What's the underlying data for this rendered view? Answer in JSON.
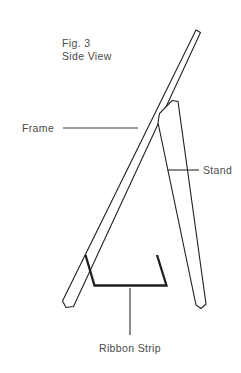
{
  "figure": {
    "title_line1": "Fig. 3",
    "title_line2": "Side View",
    "background_color": "#ffffff",
    "line_color": "#231f20",
    "text_color": "#4a4a4a",
    "leader_color": "#3d3d3d",
    "width": 241,
    "height": 373
  },
  "labels": {
    "frame": "Frame",
    "stand": "Stand",
    "ribbon_strip": "Ribbon Strip"
  },
  "diagram_data": {
    "type": "line-drawing",
    "subject": "easel side view",
    "parts": [
      {
        "name": "frame",
        "description": "long narrow slat leaning from upper right to lower left",
        "label": "Frame",
        "outline_points": "196,30 200,32 73,306 66,307 63,301"
      },
      {
        "name": "stand",
        "description": "narrow slat hinged near frame, angling down to lower right",
        "label": "Stand",
        "outline_points": "172,100 178,101 206,304 201,308 196,305 158,122 160,114"
      },
      {
        "name": "ribbon-strip",
        "description": "thick strip spanning between frame and stand near the bottom",
        "label": "Ribbon Strip",
        "path": "M 85,255 L 94,285 L 167,285 L 157,255"
      }
    ],
    "leaders": [
      {
        "name": "frame-leader",
        "from": [
          63,
          128
        ],
        "to": [
          138,
          128
        ],
        "orientation": "horizontal"
      },
      {
        "name": "stand-leader",
        "from": [
          167,
          170
        ],
        "to": [
          199,
          170
        ],
        "orientation": "horizontal"
      },
      {
        "name": "ribbon-strip-leader",
        "from": [
          130,
          288
        ],
        "to": [
          130,
          335
        ],
        "orientation": "vertical"
      }
    ]
  }
}
